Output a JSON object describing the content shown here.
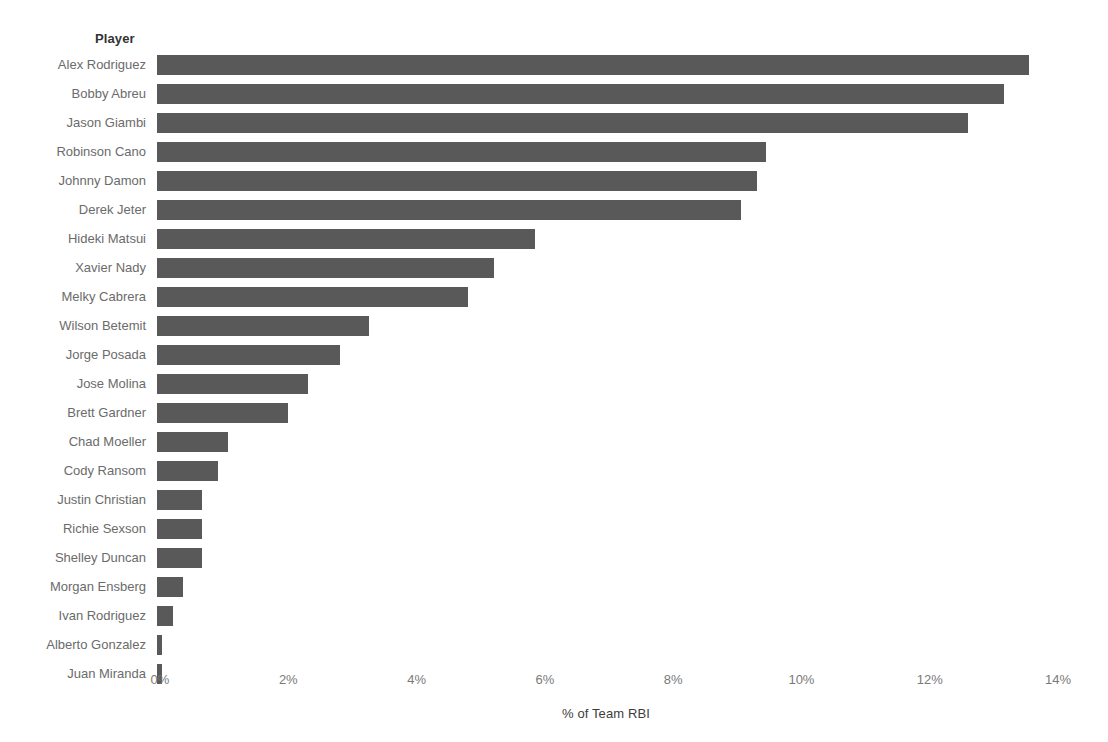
{
  "chart_data": {
    "type": "bar",
    "orientation": "horizontal",
    "title": "",
    "subtitle": "",
    "xlabel": "% of Team RBI",
    "ylabel": "Player",
    "xlim": [
      0,
      14.5
    ],
    "xticks": [
      0,
      2,
      4,
      6,
      8,
      10,
      12,
      14
    ],
    "xtick_labels": [
      "0%",
      "2%",
      "4%",
      "6%",
      "8%",
      "10%",
      "12%",
      "14%"
    ],
    "grid": false,
    "legend": null,
    "bar_color": "#595959",
    "categories": [
      "Alex Rodriguez",
      "Bobby Abreu",
      "Jason Giambi",
      "Robinson Cano",
      "Johnny Damon",
      "Derek Jeter",
      "Hideki Matsui",
      "Xavier Nady",
      "Melky Cabrera",
      "Wilson Betemit",
      "Jorge Posada",
      "Jose Molina",
      "Brett Gardner",
      "Chad Moeller",
      "Cody Ransom",
      "Justin Christian",
      "Richie Sexson",
      "Shelley Duncan",
      "Morgan Ensberg",
      "Ivan Rodriguez",
      "Alberto Gonzalez",
      "Juan Miranda"
    ],
    "values": [
      13.6,
      13.2,
      12.65,
      9.5,
      9.35,
      9.1,
      5.9,
      5.25,
      4.85,
      3.3,
      2.85,
      2.35,
      2.05,
      1.1,
      0.95,
      0.7,
      0.7,
      0.7,
      0.4,
      0.25,
      0.08,
      0.08
    ]
  },
  "axis": {
    "y_title": "Player",
    "x_title": "% of Team RBI"
  }
}
